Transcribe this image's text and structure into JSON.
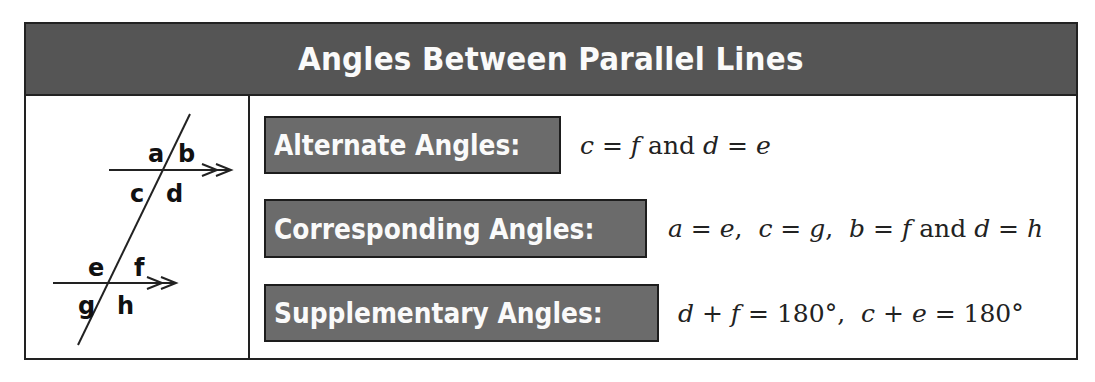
{
  "header": {
    "title": "Angles Between Parallel Lines"
  },
  "diagram": {
    "labels": {
      "a": "a",
      "b": "b",
      "c": "c",
      "d": "d",
      "e": "e",
      "f": "f",
      "g": "g",
      "h": "h"
    },
    "arrow_marker": ">>"
  },
  "rules": [
    {
      "label": "Alternate Angles:",
      "equation": "c = f and d = e"
    },
    {
      "label": "Corresponding Angles:",
      "equation": "a = e,  c = g,  b = f and d = h"
    },
    {
      "label": "Supplementary Angles:",
      "equation": "d + f = 180°,  c + e = 180°"
    }
  ],
  "colors": {
    "header_bg": "#555555",
    "label_bg": "#6b6b6b",
    "border": "#222222",
    "text_light": "#fafafa"
  }
}
